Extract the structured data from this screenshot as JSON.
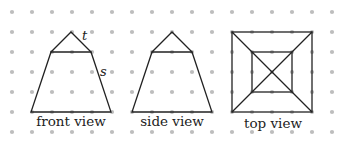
{
  "figure": {
    "views": [
      {
        "id": "front",
        "label": "front view",
        "shape": "triangle atop trapezoid",
        "edge_labels": [
          "t",
          "s"
        ]
      },
      {
        "id": "side",
        "label": "side view",
        "shape": "triangle atop trapezoid",
        "edge_labels": []
      },
      {
        "id": "top",
        "label": "top view",
        "shape": "square with inner square and diagonals",
        "edge_labels": []
      }
    ],
    "edge_label_t": "t",
    "edge_label_s": "s",
    "grid": {
      "columns": 17,
      "rows": 7,
      "style": "dot grid"
    },
    "colors": {
      "dots": "#bdbdbd",
      "lines": "#222222",
      "text": "#222222"
    }
  }
}
